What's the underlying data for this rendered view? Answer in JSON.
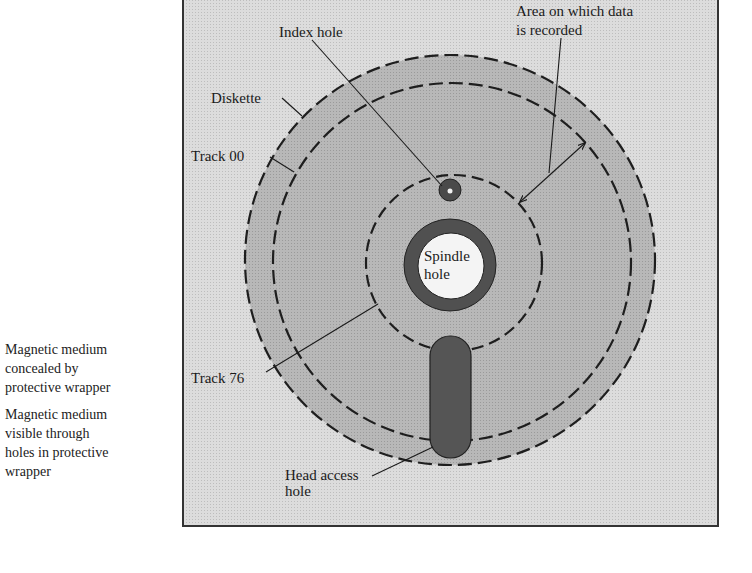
{
  "diagram": {
    "type": "floppy-diskette-layout",
    "colors": {
      "wrapper_background": "#d6d6d6",
      "diskette_medium": "#b4b4b4",
      "exposed_medium": "#5a5a5a",
      "spindle_center": "#f4f4f4",
      "dashed_line": "#1e1e1e",
      "frame_border": "#333333"
    },
    "labels": {
      "index_hole": "Index hole",
      "area_line1": "Area on which data",
      "area_line2": "is recorded",
      "diskette": "Diskette",
      "track_00": "Track 00",
      "spindle_line1": "Spindle",
      "spindle_line2": "hole",
      "track_76": "Track 76",
      "head_access_line1": "Head access",
      "head_access_line2": "hole"
    }
  },
  "legend": {
    "items": [
      {
        "lines": [
          "Magnetic medium",
          "concealed by",
          "protective wrapper"
        ]
      },
      {
        "lines": [
          "Magnetic medium",
          "visible through",
          "holes in protective",
          "wrapper"
        ]
      }
    ]
  }
}
